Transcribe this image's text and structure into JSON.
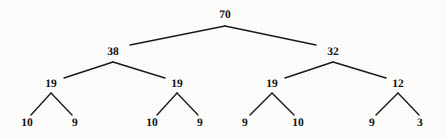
{
  "figure": {
    "kind": "binary-tree-diagram",
    "width": 446,
    "height": 138,
    "background_color": "#fdfdfc",
    "edge_color": "#1a1a1a",
    "text_color": "#121212"
  },
  "tree": {
    "levels": [
      {
        "level": 0,
        "nodes": [
          {
            "id": "n0",
            "label": "70",
            "x": 225,
            "y": 16
          }
        ]
      },
      {
        "level": 1,
        "nodes": [
          {
            "id": "n1",
            "label": "38",
            "x": 113,
            "y": 53
          },
          {
            "id": "n2",
            "label": "32",
            "x": 333,
            "y": 53
          }
        ]
      },
      {
        "level": 2,
        "nodes": [
          {
            "id": "n3",
            "label": "19",
            "x": 51,
            "y": 85
          },
          {
            "id": "n4",
            "label": "19",
            "x": 177,
            "y": 85
          },
          {
            "id": "n5",
            "label": "19",
            "x": 272,
            "y": 85
          },
          {
            "id": "n6",
            "label": "12",
            "x": 398,
            "y": 85
          }
        ]
      },
      {
        "level": 3,
        "nodes": [
          {
            "id": "n7",
            "label": "10",
            "x": 27,
            "y": 124
          },
          {
            "id": "n8",
            "label": "9",
            "x": 75,
            "y": 124
          },
          {
            "id": "n9",
            "label": "10",
            "x": 152,
            "y": 124
          },
          {
            "id": "n10",
            "label": "9",
            "x": 200,
            "y": 124
          },
          {
            "id": "n11",
            "label": "9",
            "x": 245,
            "y": 124
          },
          {
            "id": "n12",
            "label": "10",
            "x": 298,
            "y": 124
          },
          {
            "id": "n13",
            "label": "9",
            "x": 372,
            "y": 124
          },
          {
            "id": "n14",
            "label": "3",
            "x": 420,
            "y": 124
          }
        ]
      }
    ],
    "edges": [
      {
        "from": "n0",
        "to": "n1",
        "x1": 225,
        "y1": 26,
        "x2": 130,
        "y2": 45
      },
      {
        "from": "n0",
        "to": "n2",
        "x1": 225,
        "y1": 26,
        "x2": 316,
        "y2": 45
      },
      {
        "from": "n1",
        "to": "n3",
        "x1": 113,
        "y1": 62,
        "x2": 64,
        "y2": 78
      },
      {
        "from": "n1",
        "to": "n4",
        "x1": 113,
        "y1": 62,
        "x2": 165,
        "y2": 78
      },
      {
        "from": "n2",
        "to": "n5",
        "x1": 333,
        "y1": 62,
        "x2": 285,
        "y2": 78
      },
      {
        "from": "n2",
        "to": "n6",
        "x1": 333,
        "y1": 62,
        "x2": 386,
        "y2": 78
      },
      {
        "from": "n3",
        "to": "n7",
        "x1": 51,
        "y1": 93,
        "x2": 31,
        "y2": 115
      },
      {
        "from": "n3",
        "to": "n8",
        "x1": 51,
        "y1": 93,
        "x2": 72,
        "y2": 115
      },
      {
        "from": "n4",
        "to": "n9",
        "x1": 177,
        "y1": 93,
        "x2": 157,
        "y2": 115
      },
      {
        "from": "n4",
        "to": "n10",
        "x1": 177,
        "y1": 93,
        "x2": 198,
        "y2": 115
      },
      {
        "from": "n5",
        "to": "n11",
        "x1": 272,
        "y1": 93,
        "x2": 250,
        "y2": 115
      },
      {
        "from": "n5",
        "to": "n12",
        "x1": 272,
        "y1": 93,
        "x2": 294,
        "y2": 115
      },
      {
        "from": "n6",
        "to": "n13",
        "x1": 398,
        "y1": 93,
        "x2": 376,
        "y2": 115
      },
      {
        "from": "n6",
        "to": "n14",
        "x1": 398,
        "y1": 93,
        "x2": 419,
        "y2": 115
      }
    ]
  }
}
